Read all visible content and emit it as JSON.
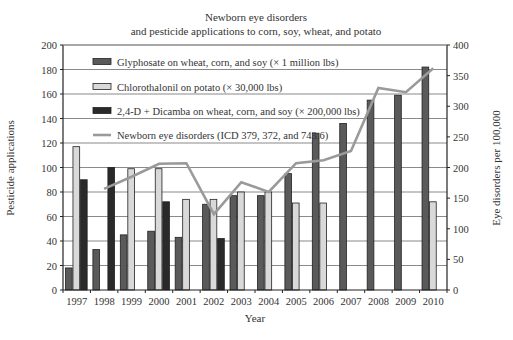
{
  "chart_data": {
    "type": "bar",
    "title": "Newborn eye disorders",
    "subtitle": "and pesticide applications to corn, soy, wheat, and potato",
    "xlabel": "Year",
    "ylabel": "Pesticide applications",
    "y2label": "Eye disorders per 100,000",
    "ylim": [
      0,
      200
    ],
    "y2lim": [
      0,
      400
    ],
    "yticks": [
      0,
      20,
      40,
      60,
      80,
      100,
      120,
      140,
      160,
      180,
      200
    ],
    "y2ticks": [
      0,
      50,
      100,
      150,
      200,
      250,
      300,
      350,
      400
    ],
    "grid": true,
    "legend_position": "upper-left inside",
    "categories": [
      "1997",
      "1998",
      "1999",
      "2000",
      "2001",
      "2002",
      "2003",
      "2004",
      "2005",
      "2006",
      "2007",
      "2008",
      "2009",
      "2010"
    ],
    "series": [
      {
        "name": "Glyphosate on wheat, corn, and soy (× 1 million lbs)",
        "type": "bar",
        "axis": "left",
        "color": "#5a5a5a",
        "values": [
          18,
          33,
          45,
          48,
          43,
          70,
          77,
          77,
          95,
          128,
          136,
          155,
          159,
          182
        ]
      },
      {
        "name": "Chlorothalonil on potato (× 30,000 lbs)",
        "type": "bar",
        "axis": "left",
        "color": "#d9d9d9",
        "values": [
          117,
          null,
          99,
          99,
          74,
          74,
          80,
          80,
          71,
          71,
          null,
          null,
          null,
          72
        ]
      },
      {
        "name": "2,4-D + Dicamba on wheat, corn, and soy (× 200,000 lbs)",
        "type": "bar",
        "axis": "left",
        "color": "#2a2a2a",
        "values": [
          90,
          100,
          null,
          72,
          null,
          42,
          null,
          null,
          null,
          null,
          null,
          null,
          null,
          null
        ]
      },
      {
        "name": "Newborn eye disorders (ICD 379, 372, and 743.6)",
        "type": "line",
        "axis": "right",
        "color": "#9a9a9a",
        "values": [
          null,
          165,
          185,
          206,
          207,
          124,
          176,
          160,
          207,
          212,
          227,
          330,
          323,
          362
        ]
      }
    ]
  }
}
